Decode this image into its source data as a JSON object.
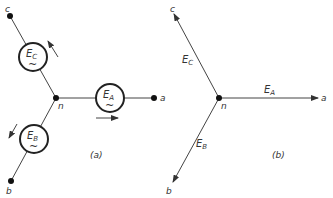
{
  "diagram_a": {
    "caption": "(a)",
    "neutral_label": "n",
    "terminals": {
      "a": "a",
      "b": "b",
      "c": "c"
    },
    "sources": [
      {
        "id": "A",
        "base": "E",
        "sub": "A",
        "symbol": "~"
      },
      {
        "id": "B",
        "base": "E",
        "sub": "B",
        "symbol": "~"
      },
      {
        "id": "C",
        "base": "E",
        "sub": "C",
        "symbol": "~"
      }
    ]
  },
  "diagram_b": {
    "caption": "(b)",
    "neutral_label": "n",
    "terminals": {
      "a": "a",
      "b": "b",
      "c": "c"
    },
    "phasors": [
      {
        "id": "A",
        "base": "E",
        "sub": "A"
      },
      {
        "id": "B",
        "base": "E",
        "sub": "B"
      },
      {
        "id": "C",
        "base": "E",
        "sub": "C"
      }
    ]
  },
  "colors": {
    "line": "#444444",
    "text": "#333333",
    "background": "#ffffff"
  }
}
